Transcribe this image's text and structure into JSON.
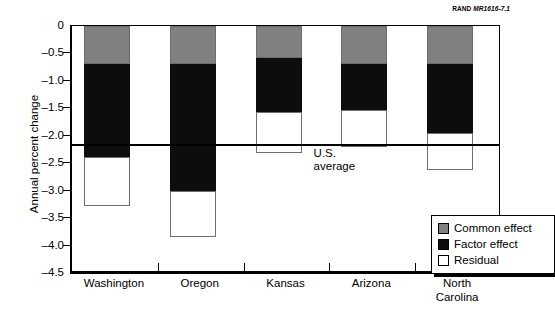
{
  "figure_credit": {
    "publisher": "RAND",
    "number": "MR1616-7.1"
  },
  "chart_data": {
    "type": "bar",
    "subtype": "stacked-bar",
    "title": "",
    "xlabel": "",
    "ylabel": "Annual percent change",
    "ylim": [
      -4.5,
      0
    ],
    "ytick_labels": [
      "0",
      "–0.5",
      "–1.0",
      "–1.5",
      "–2.0",
      "–2.5",
      "–3.0",
      "–3.5",
      "–4.0",
      "–4.5"
    ],
    "ytick_values": [
      0,
      -0.5,
      -1.0,
      -1.5,
      -2.0,
      -2.5,
      -3.0,
      -3.5,
      -4.0,
      -4.5
    ],
    "grid": false,
    "legend_position": "inside-bottom-right",
    "categories": [
      "Washington",
      "Oregon",
      "Kansas",
      "Arizona",
      "North Carolina"
    ],
    "category_label_lines": [
      [
        "Washington"
      ],
      [
        "Oregon"
      ],
      [
        "Kansas"
      ],
      [
        "Arizona"
      ],
      [
        "North",
        "Carolina"
      ]
    ],
    "series": [
      {
        "name": "Common effect",
        "color": "#808080",
        "values": [
          -0.7,
          -0.7,
          -0.58,
          -0.7,
          -0.7
        ]
      },
      {
        "name": "Factor effect",
        "color": "#0d0d0d",
        "values": [
          -1.68,
          -2.3,
          -0.99,
          -0.83,
          -1.25
        ]
      },
      {
        "name": "Residual",
        "color": "#ffffff",
        "values": [
          -0.9,
          -0.85,
          -0.75,
          -0.67,
          -0.67
        ]
      }
    ],
    "cumulative_tops": [
      {
        "category": "Washington",
        "common_end": -0.7,
        "factor_end": -2.38,
        "residual_end": -3.28
      },
      {
        "category": "Oregon",
        "common_end": -0.7,
        "factor_end": -3.0,
        "residual_end": -3.85
      },
      {
        "category": "Kansas",
        "common_end": -0.58,
        "factor_end": -1.57,
        "residual_end": -2.32
      },
      {
        "category": "Arizona",
        "common_end": -0.7,
        "factor_end": -1.53,
        "residual_end": -2.2
      },
      {
        "category": "North Carolina",
        "common_end": -0.7,
        "factor_end": -1.95,
        "residual_end": -2.62
      }
    ],
    "totals": [
      -3.28,
      -3.85,
      -2.32,
      -2.2,
      -2.62
    ],
    "reference_line": {
      "label_lines": [
        "U.S.",
        "average"
      ],
      "label": "U.S. average",
      "value": -2.15
    },
    "legend": [
      {
        "label": "Common effect",
        "color": "#808080"
      },
      {
        "label": "Factor effect",
        "color": "#0d0d0d"
      },
      {
        "label": "Residual",
        "color": "#ffffff"
      }
    ]
  },
  "colors": {
    "common_effect": "#808080",
    "factor_effect": "#0d0d0d",
    "residual": "#ffffff",
    "axis": "#000000",
    "background": "#ffffff"
  }
}
